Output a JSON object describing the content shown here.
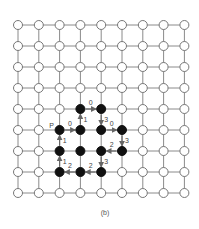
{
  "diagram": {
    "caption": "(b)",
    "grid": {
      "cols": 9,
      "rows": 9,
      "x0": 18,
      "y0": 25,
      "dx": 20.8,
      "dy": 21,
      "line_color": "#8a8a8a",
      "node_fill": "#ffffff",
      "node_stroke": "#777777",
      "black_fill": "#111111",
      "node_radius": 4.5
    },
    "black_nodes": [
      [
        3,
        4
      ],
      [
        4,
        4
      ],
      [
        2,
        5
      ],
      [
        3,
        5
      ],
      [
        4,
        5
      ],
      [
        5,
        5
      ],
      [
        2,
        6
      ],
      [
        3,
        6
      ],
      [
        4,
        6
      ],
      [
        5,
        6
      ],
      [
        2,
        7
      ],
      [
        3,
        7
      ],
      [
        4,
        7
      ]
    ],
    "start_label": {
      "text": "P",
      "node": [
        2,
        5
      ]
    },
    "arrows": [
      {
        "from": [
          3,
          4
        ],
        "to": [
          4,
          4
        ],
        "label": "0"
      },
      {
        "from": [
          4,
          4
        ],
        "to": [
          4,
          5
        ],
        "label": "3"
      },
      {
        "from": [
          2,
          5
        ],
        "to": [
          3,
          5
        ],
        "label": "0"
      },
      {
        "from": [
          3,
          5
        ],
        "to": [
          3,
          4
        ],
        "label": "1"
      },
      {
        "from": [
          4,
          5
        ],
        "to": [
          5,
          5
        ],
        "label": "0"
      },
      {
        "from": [
          5,
          5
        ],
        "to": [
          5,
          6
        ],
        "label": "3"
      },
      {
        "from": [
          5,
          6
        ],
        "to": [
          4,
          6
        ],
        "label": "2"
      },
      {
        "from": [
          4,
          6
        ],
        "to": [
          4,
          7
        ],
        "label": "3"
      },
      {
        "from": [
          4,
          7
        ],
        "to": [
          3,
          7
        ],
        "label": "2"
      },
      {
        "from": [
          3,
          7
        ],
        "to": [
          2,
          7
        ],
        "label": "2"
      },
      {
        "from": [
          2,
          7
        ],
        "to": [
          2,
          6
        ],
        "label": "1"
      },
      {
        "from": [
          2,
          6
        ],
        "to": [
          2,
          5
        ],
        "label": "1"
      }
    ]
  }
}
